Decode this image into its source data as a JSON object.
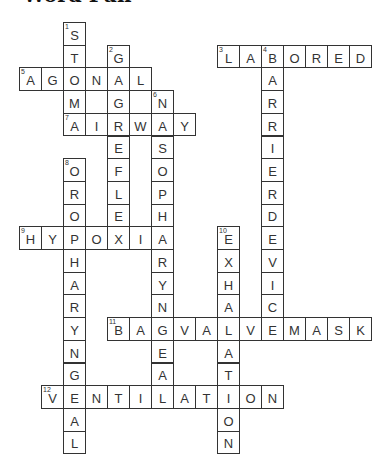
{
  "title": "Word Fun",
  "grid": {
    "origin_x": 19,
    "origin_y": 22,
    "cell_w": 22,
    "cell_h": 22.7,
    "line_color": "#333333"
  },
  "words": [
    {
      "number": 1,
      "answer": "STOMA",
      "direction": "down",
      "row": 0,
      "col": 2
    },
    {
      "number": 2,
      "answer": "GAGREFLEX",
      "direction": "down",
      "row": 1,
      "col": 4
    },
    {
      "number": 3,
      "answer": "LABORED",
      "direction": "across",
      "row": 1,
      "col": 9
    },
    {
      "number": 4,
      "answer": "BARRIERDEVICE",
      "direction": "down",
      "row": 1,
      "col": 11
    },
    {
      "number": 5,
      "answer": "AGONAL",
      "direction": "across",
      "row": 2,
      "col": 0
    },
    {
      "number": 6,
      "answer": "NASOPHARYNGEAL",
      "direction": "down",
      "row": 3,
      "col": 6
    },
    {
      "number": 7,
      "answer": "AIRWAY",
      "direction": "across",
      "row": 4,
      "col": 2
    },
    {
      "number": 8,
      "answer": "OROPHARYNGEAL",
      "direction": "down",
      "row": 6,
      "col": 2
    },
    {
      "number": 9,
      "answer": "HYPOXIA",
      "direction": "across",
      "row": 9,
      "col": 0
    },
    {
      "number": 10,
      "answer": "EXHALATION",
      "direction": "down",
      "row": 9,
      "col": 9
    },
    {
      "number": 11,
      "answer": "BAGVALVEMASK",
      "direction": "across",
      "row": 13,
      "col": 4
    },
    {
      "number": 12,
      "answer": "VENTILATION",
      "direction": "across",
      "row": 16,
      "col": 1
    }
  ]
}
